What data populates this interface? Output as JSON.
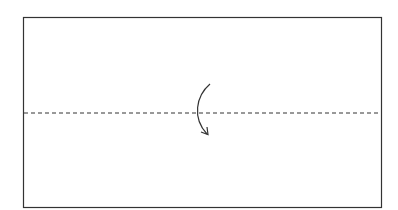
{
  "diagram": {
    "type": "fold-instruction",
    "rectangle": {
      "x": 23.5,
      "y": 17.5,
      "width": 358,
      "height": 190,
      "stroke": "#333333"
    },
    "fold_line": {
      "x1": 24,
      "y1": 113,
      "x2": 381,
      "y2": 113,
      "style": "dashed",
      "stroke": "#333333"
    },
    "arrow": {
      "direction": "down",
      "curve": "left-bulge",
      "stroke": "#333333"
    },
    "colors": {
      "background": "#ffffff",
      "line": "#333333"
    }
  }
}
